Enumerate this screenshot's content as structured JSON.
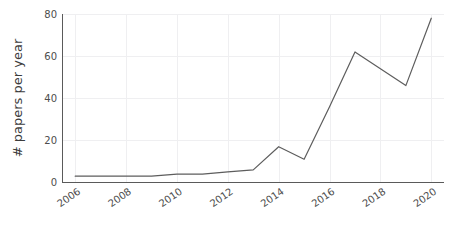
{
  "chart_data": {
    "type": "line",
    "title": "",
    "subtitle": "",
    "xlabel": "",
    "ylabel": "# papers per year",
    "xlim": [
      2005.5,
      2020.5
    ],
    "ylim": [
      0,
      80
    ],
    "grid": true,
    "legend": false,
    "legend_position": "none",
    "line_color": "#5d5d5d",
    "axis_color": "#5a5a5a",
    "grid_color": "#efeff1",
    "x_tick_labels": [
      "2006",
      "2008",
      "2010",
      "2012",
      "2014",
      "2016",
      "2018",
      "2020"
    ],
    "x_tick_values": [
      2006,
      2008,
      2010,
      2012,
      2014,
      2016,
      2018,
      2020
    ],
    "x_tick_rotation": 35,
    "y_tick_labels": [
      "0",
      "20",
      "40",
      "60",
      "80"
    ],
    "y_tick_values": [
      0,
      20,
      40,
      60,
      80
    ],
    "x": [
      2006,
      2007,
      2008,
      2009,
      2010,
      2011,
      2012,
      2013,
      2014,
      2015,
      2016,
      2017,
      2018,
      2019,
      2020
    ],
    "series": [
      {
        "name": "# papers per year",
        "values": [
          3,
          3,
          3,
          3,
          4,
          4,
          5,
          6,
          17,
          11,
          36,
          62,
          54,
          46,
          78
        ]
      }
    ]
  },
  "axes": {
    "y_axis_title": "# papers per year"
  }
}
